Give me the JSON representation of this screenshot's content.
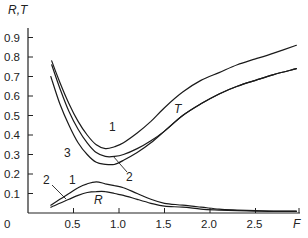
{
  "chart_data": {
    "type": "line",
    "title": "",
    "xlabel": "F",
    "ylabel": "R,T",
    "xlim": [
      0,
      2.95
    ],
    "ylim": [
      0,
      0.95
    ],
    "grid": false,
    "legend": "none (curves labeled inline with numbers 1, 2, 3)",
    "x_ticks": [
      0,
      0.5,
      1.0,
      1.5,
      2.0,
      2.5
    ],
    "x_tick_labels": [
      "0",
      "0.5",
      "1.0",
      "1.5",
      "2.0",
      "2.5"
    ],
    "y_ticks": [
      0.1,
      0.2,
      0.3,
      0.4,
      0.5,
      0.6,
      0.7,
      0.8,
      0.9
    ],
    "y_tick_labels": [
      "0.1",
      "0.2",
      "0.3",
      "0.4",
      "0.5",
      "0.6",
      "0.7",
      "0.8",
      "0.9"
    ],
    "series": [
      {
        "name": "T curve 1",
        "group": "T",
        "label": "1",
        "x": [
          0.26,
          0.35,
          0.45,
          0.55,
          0.65,
          0.75,
          0.85,
          0.95,
          1.05,
          1.2,
          1.35,
          1.5,
          1.7,
          1.9,
          2.1,
          2.3,
          2.5,
          2.7,
          2.95
        ],
        "y": [
          0.78,
          0.67,
          0.56,
          0.47,
          0.4,
          0.35,
          0.33,
          0.34,
          0.36,
          0.41,
          0.47,
          0.54,
          0.62,
          0.68,
          0.72,
          0.76,
          0.79,
          0.82,
          0.86
        ]
      },
      {
        "name": "T curve 2",
        "group": "T",
        "label": "2",
        "x": [
          0.26,
          0.35,
          0.45,
          0.55,
          0.65,
          0.75,
          0.85,
          0.95,
          1.05,
          1.2,
          1.35,
          1.5,
          1.7,
          1.9,
          2.1,
          2.3,
          2.5,
          2.7,
          2.95
        ],
        "y": [
          0.76,
          0.64,
          0.52,
          0.43,
          0.36,
          0.31,
          0.29,
          0.29,
          0.3,
          0.33,
          0.37,
          0.42,
          0.5,
          0.56,
          0.61,
          0.65,
          0.68,
          0.71,
          0.74
        ]
      },
      {
        "name": "T curve 3",
        "group": "T",
        "label": "3",
        "x": [
          0.25,
          0.35,
          0.45,
          0.55,
          0.65,
          0.75,
          0.85,
          0.95,
          1.05,
          1.2,
          1.35,
          1.5,
          1.7,
          1.9,
          2.1,
          2.3,
          2.5,
          2.7,
          2.95
        ],
        "y": [
          0.7,
          0.56,
          0.45,
          0.36,
          0.3,
          0.26,
          0.25,
          0.25,
          0.27,
          0.31,
          0.36,
          0.42,
          0.5,
          0.56,
          0.61,
          0.65,
          0.68,
          0.71,
          0.74
        ]
      },
      {
        "name": "R curve 1",
        "group": "R",
        "label": "1",
        "x": [
          0.25,
          0.35,
          0.45,
          0.55,
          0.65,
          0.75,
          0.85,
          0.95,
          1.05,
          1.2,
          1.35,
          1.5,
          1.7,
          1.9,
          2.1,
          2.3,
          2.5,
          2.7,
          2.95
        ],
        "y": [
          0.04,
          0.07,
          0.1,
          0.13,
          0.15,
          0.16,
          0.15,
          0.14,
          0.13,
          0.1,
          0.07,
          0.05,
          0.04,
          0.03,
          0.02,
          0.015,
          0.012,
          0.01,
          0.01
        ]
      },
      {
        "name": "R curve 2",
        "group": "R",
        "label": "2",
        "x": [
          0.25,
          0.35,
          0.45,
          0.55,
          0.65,
          0.75,
          0.85,
          0.95,
          1.05,
          1.2,
          1.35,
          1.5,
          1.7,
          1.9,
          2.1,
          2.3,
          2.5,
          2.7,
          2.95
        ],
        "y": [
          0.03,
          0.05,
          0.07,
          0.09,
          0.105,
          0.11,
          0.11,
          0.1,
          0.09,
          0.07,
          0.05,
          0.035,
          0.03,
          0.02,
          0.015,
          0.012,
          0.01,
          0.008,
          0.008
        ]
      }
    ],
    "annotations": [
      {
        "text": "1",
        "near": "T curve 1 minimum",
        "x": 0.93,
        "y": 0.44
      },
      {
        "text": "2",
        "near": "T curve 2 (leader line)",
        "x": 1.1,
        "y": 0.19
      },
      {
        "text": "3",
        "near": "T curve 3 left branch",
        "x": 0.45,
        "y": 0.31
      },
      {
        "text": "T",
        "near": "T curves",
        "x": 1.65,
        "y": 0.53
      },
      {
        "text": "1",
        "near": "R curve 1",
        "x": 0.47,
        "y": 0.17
      },
      {
        "text": "2",
        "near": "R curve 2 (leader line)",
        "x": 0.2,
        "y": 0.17
      },
      {
        "text": "R",
        "near": "R curves",
        "x": 0.77,
        "y": 0.07
      }
    ]
  },
  "labels": {
    "y_axis": "R,T",
    "x_axis": "F",
    "origin": "0",
    "curve_1": "1",
    "curve_2": "2",
    "curve_3": "3",
    "T": "T",
    "R": "R"
  }
}
